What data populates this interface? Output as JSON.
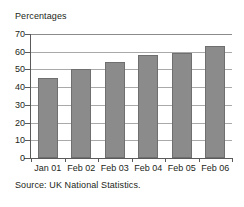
{
  "chart_data": {
    "type": "bar",
    "title": "",
    "ylabel": "Percentages",
    "xlabel": "",
    "categories": [
      "Jan 01",
      "Feb 02",
      "Feb 03",
      "Feb 04",
      "Feb 05",
      "Feb 06"
    ],
    "values": [
      45,
      50,
      54,
      58,
      59.5,
      63.5
    ],
    "ylim": [
      0,
      70
    ],
    "ytick_step": 10,
    "yticks": [
      0,
      10,
      20,
      30,
      40,
      50,
      60,
      70
    ],
    "ytick_labels": [
      "0",
      "10",
      "20",
      "30",
      "40",
      "50",
      "60",
      "70"
    ],
    "grid": true,
    "legend": false,
    "bar_color": "#8b8b8b",
    "bar_edge_color": "#6f6f6f",
    "gridline_color": "#a9a9a9",
    "axis_color": "#5a5a5a",
    "background": "#ffffff",
    "annotations": [
      "Source: UK National Statistics."
    ]
  },
  "axis_title": "Percentages",
  "source_note": "Source: UK National Statistics."
}
